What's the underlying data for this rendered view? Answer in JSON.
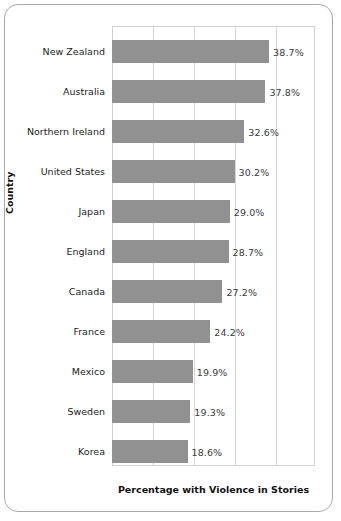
{
  "chart_data": {
    "type": "bar",
    "orientation": "horizontal",
    "title": "",
    "xlabel": "Percentage with Violence in Stories",
    "ylabel": "Country",
    "categories": [
      "New Zealand",
      "Australia",
      "Northern Ireland",
      "United States",
      "Japan",
      "England",
      "Canada",
      "France",
      "Mexico",
      "Sweden",
      "Korea"
    ],
    "values": [
      38.7,
      37.8,
      32.6,
      30.2,
      29.0,
      28.7,
      27.2,
      24.2,
      19.9,
      19.3,
      18.6
    ],
    "value_labels": [
      "38.7%",
      "37.8%",
      "32.6%",
      "30.2%",
      "29.0%",
      "28.7%",
      "27.2%",
      "24.2%",
      "19.9%",
      "19.3%",
      "18.6%"
    ],
    "xlim": [
      0,
      50
    ],
    "xticks": [
      0,
      10,
      20,
      30,
      40,
      50
    ],
    "grid": "vertical",
    "legend": "none",
    "bar_color": "#919191",
    "gridline_color": "#d6d6d6",
    "frame_color": "#a9a9a9"
  }
}
